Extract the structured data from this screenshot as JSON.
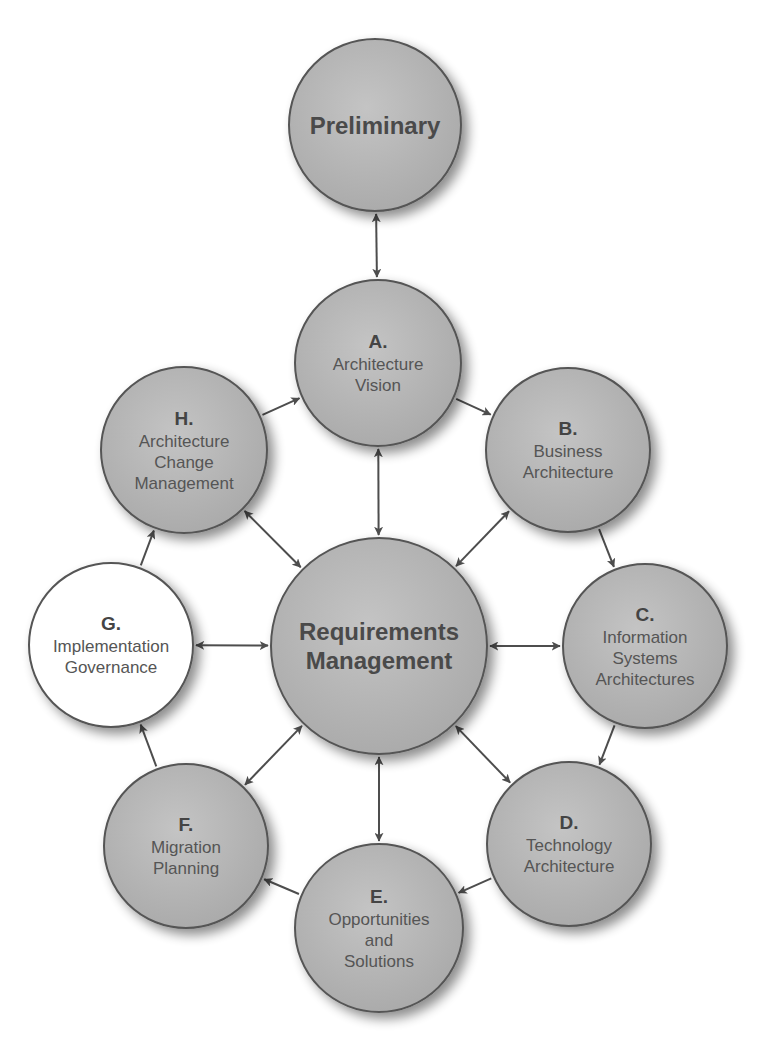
{
  "diagram": {
    "colors": {
      "node_fill": "#b4b4b4",
      "node_fill_highlight": "#ffffff",
      "stroke": "#555555",
      "arrow": "#4d4d4d",
      "text": "#555555"
    },
    "nodes": [
      {
        "id": "prelim",
        "letter": "",
        "lines": [
          "Preliminary"
        ],
        "cx": 375,
        "cy": 125,
        "r": 86,
        "fill": "gray",
        "bold": true
      },
      {
        "id": "A",
        "letter": "A.",
        "lines": [
          "Architecture",
          "Vision"
        ],
        "cx": 378,
        "cy": 363,
        "r": 83,
        "fill": "gray"
      },
      {
        "id": "B",
        "letter": "B.",
        "lines": [
          "Business",
          "Architecture"
        ],
        "cx": 568,
        "cy": 450,
        "r": 82,
        "fill": "gray"
      },
      {
        "id": "C",
        "letter": "C.",
        "lines": [
          "Information",
          "Systems",
          "Architectures"
        ],
        "cx": 645,
        "cy": 646,
        "r": 82,
        "fill": "gray"
      },
      {
        "id": "D",
        "letter": "D.",
        "lines": [
          "Technology",
          "Architecture"
        ],
        "cx": 569,
        "cy": 844,
        "r": 82,
        "fill": "gray"
      },
      {
        "id": "E",
        "letter": "E.",
        "lines": [
          "Opportunities",
          "and",
          "Solutions"
        ],
        "cx": 379,
        "cy": 928,
        "r": 84,
        "fill": "gray"
      },
      {
        "id": "F",
        "letter": "F.",
        "lines": [
          "Migration",
          "Planning"
        ],
        "cx": 186,
        "cy": 846,
        "r": 82,
        "fill": "gray"
      },
      {
        "id": "G",
        "letter": "G.",
        "lines": [
          "Implementation",
          "Governance"
        ],
        "cx": 111,
        "cy": 645,
        "r": 82,
        "fill": "white"
      },
      {
        "id": "H",
        "letter": "H.",
        "lines": [
          "Architecture",
          "Change",
          "Management"
        ],
        "cx": 184,
        "cy": 450,
        "r": 83,
        "fill": "gray"
      },
      {
        "id": "RM",
        "letter": "",
        "lines": [
          "Requirements",
          "Management"
        ],
        "cx": 379,
        "cy": 646,
        "r": 108,
        "fill": "gray",
        "bold": true
      }
    ],
    "edges": [
      {
        "from": "prelim",
        "to": "A",
        "bidirectional": true
      },
      {
        "from": "A",
        "to": "B",
        "bidirectional": false
      },
      {
        "from": "B",
        "to": "C",
        "bidirectional": false
      },
      {
        "from": "C",
        "to": "D",
        "bidirectional": false
      },
      {
        "from": "D",
        "to": "E",
        "bidirectional": false
      },
      {
        "from": "E",
        "to": "F",
        "bidirectional": false
      },
      {
        "from": "F",
        "to": "G",
        "bidirectional": false
      },
      {
        "from": "G",
        "to": "H",
        "bidirectional": false
      },
      {
        "from": "H",
        "to": "A",
        "bidirectional": false
      },
      {
        "from": "RM",
        "to": "A",
        "bidirectional": true
      },
      {
        "from": "RM",
        "to": "B",
        "bidirectional": true
      },
      {
        "from": "RM",
        "to": "C",
        "bidirectional": true
      },
      {
        "from": "RM",
        "to": "D",
        "bidirectional": true
      },
      {
        "from": "RM",
        "to": "E",
        "bidirectional": true
      },
      {
        "from": "RM",
        "to": "F",
        "bidirectional": true
      },
      {
        "from": "RM",
        "to": "G",
        "bidirectional": true
      },
      {
        "from": "RM",
        "to": "H",
        "bidirectional": true
      }
    ]
  }
}
